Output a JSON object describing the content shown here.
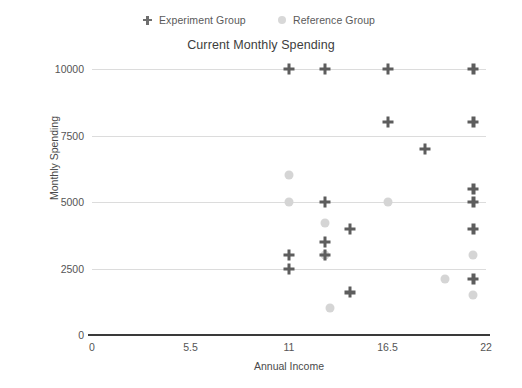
{
  "chart_data": {
    "type": "scatter",
    "title": "Current Monthly Spending",
    "xlabel": "Annual Income",
    "ylabel": "Monthly Spending",
    "xlim": [
      0,
      22
    ],
    "ylim": [
      0,
      10000
    ],
    "xticks": [
      "0",
      "5.5",
      "11",
      "16.5",
      "22"
    ],
    "xtick_values": [
      0,
      5.5,
      11,
      16.5,
      22
    ],
    "yticks": [
      "0",
      "2500",
      "5000",
      "7500",
      "10000"
    ],
    "ytick_values": [
      0,
      2500,
      5000,
      7500,
      10000
    ],
    "grid": true,
    "legend_position": "top",
    "series": [
      {
        "name": "Experiment Group",
        "marker": "cross",
        "color": "#5d5d5d",
        "points": [
          [
            11.0,
            10000
          ],
          [
            13.0,
            10000
          ],
          [
            16.5,
            10000
          ],
          [
            21.3,
            10000
          ],
          [
            16.5,
            8000
          ],
          [
            21.3,
            8000
          ],
          [
            18.6,
            7000
          ],
          [
            21.3,
            5500
          ],
          [
            13.0,
            5000
          ],
          [
            21.3,
            5000
          ],
          [
            14.4,
            4000
          ],
          [
            21.3,
            4000
          ],
          [
            13.0,
            3500
          ],
          [
            11.0,
            3000
          ],
          [
            13.0,
            3000
          ],
          [
            11.0,
            2500
          ],
          [
            21.3,
            2100
          ],
          [
            14.4,
            1600
          ]
        ]
      },
      {
        "name": "Reference Group",
        "marker": "circle",
        "color": "#d5d5d5",
        "points": [
          [
            11.0,
            6000
          ],
          [
            11.0,
            5000
          ],
          [
            16.5,
            5000
          ],
          [
            13.0,
            4200
          ],
          [
            13.0,
            3000
          ],
          [
            21.3,
            3000
          ],
          [
            19.7,
            2100
          ],
          [
            21.3,
            1500
          ],
          [
            13.3,
            1000
          ]
        ]
      }
    ]
  },
  "legend": {
    "entries": [
      {
        "label": "Experiment Group",
        "marker": "cross"
      },
      {
        "label": "Reference Group",
        "marker": "circle"
      }
    ]
  }
}
